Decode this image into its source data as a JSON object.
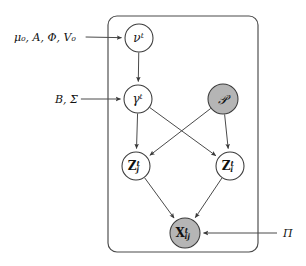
{
  "diagram": {
    "type": "directed-graphical-model",
    "colors": {
      "observed_fill": "#b5b5b5",
      "latent_fill": "#ffffff",
      "stroke": "#4a4a4a",
      "text": "#111111",
      "background": "#ffffff"
    },
    "plate": {
      "name": "time-plate",
      "x": 108,
      "y": 16,
      "width": 150,
      "height": 236,
      "corner_radius": 9,
      "label": ""
    },
    "nodes": [
      {
        "id": "nu",
        "name": "nu-node",
        "base": "ν",
        "sup": "t",
        "sub": "",
        "bold": false,
        "observed": false,
        "cx": 139,
        "cy": 38,
        "r": 14,
        "font_size": 12
      },
      {
        "id": "gamma",
        "name": "gamma-node",
        "base": "γ",
        "sup": "t",
        "sub": "",
        "bold": false,
        "observed": false,
        "cx": 138,
        "cy": 99,
        "r": 14,
        "font_size": 12
      },
      {
        "id": "script_p",
        "name": "script-p-node",
        "base": "𝒫",
        "sup": "",
        "sub": "",
        "bold": false,
        "observed": true,
        "cx": 223,
        "cy": 99,
        "r": 15,
        "font_size": 13
      },
      {
        "id": "z_j",
        "name": "z-j-node",
        "base": "Z",
        "sup": "t",
        "sub": "j",
        "bold": true,
        "observed": false,
        "cx": 136,
        "cy": 166,
        "r": 14,
        "font_size": 12
      },
      {
        "id": "z_i",
        "name": "z-i-node",
        "base": "Z",
        "sup": "t",
        "sub": "i",
        "bold": true,
        "observed": false,
        "cx": 230,
        "cy": 166,
        "r": 14,
        "font_size": 12
      },
      {
        "id": "x_ij",
        "name": "x-ij-node",
        "base": "X",
        "sup": "t",
        "sub": "ij",
        "bold": true,
        "observed": true,
        "cx": 185,
        "cy": 233,
        "r": 15,
        "font_size": 12
      }
    ],
    "hyperparameters": [
      {
        "id": "mu_a_phi_v",
        "name": "hyperparam-label-mu-a-phi-v0",
        "text": "μ₀, A, Φ, V₀",
        "x": 14,
        "y": 37,
        "font_size": 11,
        "target": "nu"
      },
      {
        "id": "b_sigma",
        "name": "hyperparam-label-b-sigma",
        "text": "B, Σ",
        "x": 55,
        "y": 99,
        "font_size": 11,
        "target": "gamma"
      },
      {
        "id": "pi",
        "name": "hyperparam-label-pi",
        "text": "Π",
        "x": 283,
        "y": 233,
        "font_size": 11,
        "target": "x_ij"
      }
    ],
    "edges": [
      {
        "name": "edge-nu-to-gamma",
        "from": "nu",
        "to": "gamma"
      },
      {
        "name": "edge-gamma-to-z-j",
        "from": "gamma",
        "to": "z_j"
      },
      {
        "name": "edge-gamma-to-z-i",
        "from": "gamma",
        "to": "z_i"
      },
      {
        "name": "edge-script-p-to-z-j",
        "from": "script_p",
        "to": "z_j"
      },
      {
        "name": "edge-script-p-to-z-i",
        "from": "script_p",
        "to": "z_i"
      },
      {
        "name": "edge-z-j-to-x-ij",
        "from": "z_j",
        "to": "x_ij"
      },
      {
        "name": "edge-z-i-to-x-ij",
        "from": "z_i",
        "to": "x_ij"
      },
      {
        "name": "edge-hyper-mu-to-nu",
        "from": "mu_a_phi_v",
        "to": "nu"
      },
      {
        "name": "edge-hyper-b-sigma-to-gamma",
        "from": "b_sigma",
        "to": "gamma"
      },
      {
        "name": "edge-hyper-pi-to-x-ij",
        "from": "pi",
        "to": "x_ij"
      }
    ]
  }
}
